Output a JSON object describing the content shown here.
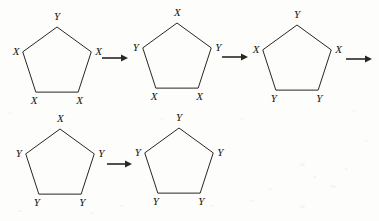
{
  "figure": {
    "background_color": "#fdfdfc",
    "stroke_color": "#2a2622",
    "label_color": "#15130f",
    "labels": {
      "x": "X",
      "y": "Y"
    },
    "arrow_glyph": "arrow-right"
  },
  "rows": [
    {
      "row_name": "row-1",
      "steps": [
        {
          "step_name": "pentagon-1",
          "index": 1,
          "cx": 57,
          "cy": 63,
          "r": 36,
          "vertices": [
            {
              "position": "top",
              "label": "Y"
            },
            {
              "position": "right",
              "label": "X"
            },
            {
              "position": "bottom-right",
              "label": "X"
            },
            {
              "position": "bottom-left",
              "label": "X"
            },
            {
              "position": "left",
              "label": "X"
            }
          ]
        },
        {
          "step_name": "pentagon-2",
          "index": 2,
          "cx": 177,
          "cy": 59,
          "r": 36,
          "vertices": [
            {
              "position": "top",
              "label": "X"
            },
            {
              "position": "right",
              "label": "Y"
            },
            {
              "position": "bottom-right",
              "label": "X"
            },
            {
              "position": "bottom-left",
              "label": "X"
            },
            {
              "position": "left",
              "label": "Y"
            }
          ]
        },
        {
          "step_name": "pentagon-3",
          "index": 3,
          "cx": 297,
          "cy": 61,
          "r": 36,
          "vertices": [
            {
              "position": "top",
              "label": "Y"
            },
            {
              "position": "right",
              "label": "X"
            },
            {
              "position": "bottom-right",
              "label": "Y"
            },
            {
              "position": "bottom-left",
              "label": "Y"
            },
            {
              "position": "left",
              "label": "X"
            }
          ]
        }
      ],
      "arrows": [
        {
          "arrow_name": "arrow-1",
          "x1": 102,
          "x2": 128,
          "y": 58
        },
        {
          "arrow_name": "arrow-2",
          "x1": 222,
          "x2": 248,
          "y": 57
        },
        {
          "arrow_name": "arrow-3",
          "x1": 346,
          "x2": 372,
          "y": 59
        }
      ]
    },
    {
      "row_name": "row-2",
      "steps": [
        {
          "step_name": "pentagon-4",
          "index": 4,
          "cx": 60,
          "cy": 165,
          "r": 36,
          "vertices": [
            {
              "position": "top",
              "label": "X"
            },
            {
              "position": "right",
              "label": "Y"
            },
            {
              "position": "bottom-right",
              "label": "Y"
            },
            {
              "position": "bottom-left",
              "label": "Y"
            },
            {
              "position": "left",
              "label": "Y"
            }
          ]
        },
        {
          "step_name": "pentagon-5",
          "index": 5,
          "cx": 179,
          "cy": 164,
          "r": 36,
          "vertices": [
            {
              "position": "top",
              "label": "Y"
            },
            {
              "position": "right",
              "label": "Y"
            },
            {
              "position": "bottom-right",
              "label": "Y"
            },
            {
              "position": "bottom-left",
              "label": "Y"
            },
            {
              "position": "left",
              "label": "Y"
            }
          ]
        }
      ],
      "arrows": [
        {
          "arrow_name": "arrow-4",
          "x1": 107,
          "x2": 132,
          "y": 164
        }
      ]
    }
  ]
}
